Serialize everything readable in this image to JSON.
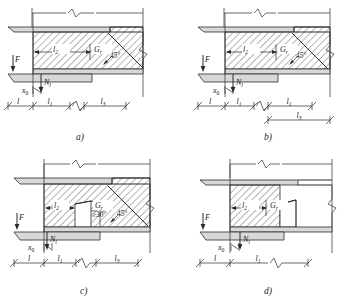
{
  "figure": {
    "type": "engineering-detail-diagram",
    "panel_count": 4,
    "colors": {
      "line": "#2b2b2b",
      "member_fill": "#d8d8d8",
      "hatch": "#2b2b2b",
      "background": "#ffffff"
    }
  },
  "panels": [
    {
      "id": "a",
      "caption": "a)",
      "has_dispersion_line": true,
      "has_white_notch": false,
      "has_second_dim_row": false,
      "angle_labels": [
        "45°"
      ],
      "load_labels": {
        "applied_force": "F",
        "local_force": "N",
        "local_force_sub": "l",
        "offset": "x",
        "offset_sub": "0"
      },
      "zone_labels": [
        {
          "text": "l",
          "sub": "2"
        },
        {
          "text": "G",
          "sub": "r"
        }
      ],
      "dimensions": {
        "row1": [
          {
            "text": "l",
            "sub": ""
          },
          {
            "text": "l",
            "sub": "1"
          },
          {
            "text": "l",
            "sub": "3"
          }
        ],
        "row2": []
      }
    },
    {
      "id": "b",
      "caption": "b)",
      "has_dispersion_line": true,
      "has_white_notch": false,
      "has_second_dim_row": true,
      "angle_labels": [
        "45°"
      ],
      "load_labels": {
        "applied_force": "F",
        "local_force": "N",
        "local_force_sub": "l",
        "offset": "x",
        "offset_sub": "0"
      },
      "zone_labels": [
        {
          "text": "l",
          "sub": "2"
        },
        {
          "text": "G",
          "sub": "r"
        }
      ],
      "dimensions": {
        "row1": [
          {
            "text": "l",
            "sub": ""
          },
          {
            "text": "l",
            "sub": "1"
          },
          {
            "text": "l",
            "sub": "1"
          }
        ],
        "row2": [
          {
            "text": "l",
            "sub": "3"
          }
        ]
      }
    },
    {
      "id": "c",
      "caption": "c)",
      "has_dispersion_line": true,
      "has_white_notch": true,
      "has_second_dim_row": false,
      "angle_labels": [
        "≥30°",
        "45°"
      ],
      "load_labels": {
        "applied_force": "F",
        "local_force": "N",
        "local_force_sub": "l",
        "offset": "x",
        "offset_sub": "0"
      },
      "zone_labels": [
        {
          "text": "l",
          "sub": "2"
        },
        {
          "text": "G",
          "sub": "r"
        }
      ],
      "dimensions": {
        "row1": [
          {
            "text": "l",
            "sub": ""
          },
          {
            "text": "l",
            "sub": "1"
          },
          {
            "text": "l",
            "sub": "3"
          }
        ],
        "row2": []
      }
    },
    {
      "id": "d",
      "caption": "d)",
      "has_dispersion_line": false,
      "has_white_notch": true,
      "has_second_dim_row": false,
      "angle_labels": [],
      "load_labels": {
        "applied_force": "F",
        "local_force": "N",
        "local_force_sub": "l",
        "offset": "x",
        "offset_sub": "0"
      },
      "zone_labels": [
        {
          "text": "l",
          "sub": "2"
        },
        {
          "text": "G",
          "sub": "r"
        }
      ],
      "dimensions": {
        "row1": [
          {
            "text": "l",
            "sub": ""
          },
          {
            "text": "l",
            "sub": "1"
          }
        ],
        "row2": []
      }
    }
  ]
}
